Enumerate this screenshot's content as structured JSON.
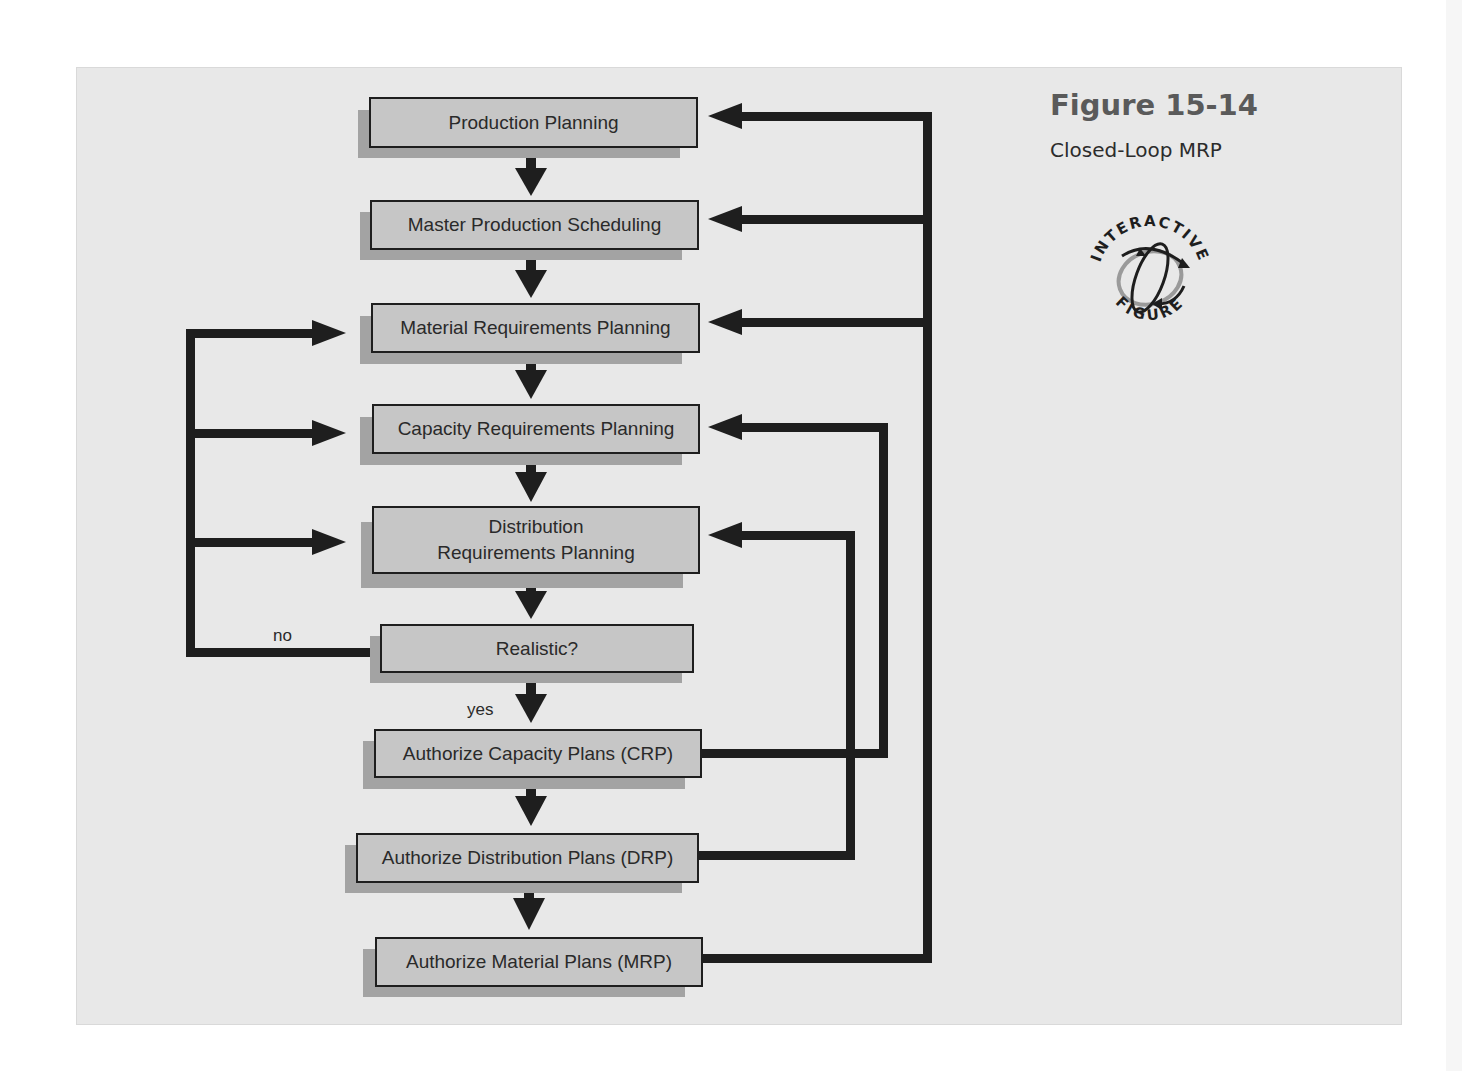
{
  "figure": {
    "number": "Figure 15-14",
    "title": "Closed-Loop MRP",
    "badge": {
      "top_text": "INTERACTIVE",
      "bottom_text": "FIGURE",
      "icon": "interactive-figure-orbit-icon"
    }
  },
  "colors": {
    "panel_bg": "#e8e8e8",
    "box_fill": "#c6c6c6",
    "box_shadow": "#a3a3a3",
    "line": "#1e1e1e",
    "title": "#5a5a5a"
  },
  "flowchart": {
    "nodes": [
      {
        "id": "production-planning",
        "label": "Production Planning"
      },
      {
        "id": "master-production-scheduling",
        "label": "Master Production Scheduling"
      },
      {
        "id": "material-requirements-planning",
        "label": "Material Requirements Planning"
      },
      {
        "id": "capacity-requirements-planning",
        "label": "Capacity Requirements Planning"
      },
      {
        "id": "distribution-requirements-planning",
        "label_line1": "Distribution",
        "label_line2": "Requirements Planning"
      },
      {
        "id": "realistic",
        "label": "Realistic?"
      },
      {
        "id": "authorize-capacity-plans",
        "label": "Authorize Capacity Plans (CRP)"
      },
      {
        "id": "authorize-distribution-plans",
        "label": "Authorize Distribution Plans (DRP)"
      },
      {
        "id": "authorize-material-plans",
        "label": "Authorize Material Plans (MRP)"
      }
    ],
    "edge_labels": {
      "no": "no",
      "yes": "yes"
    },
    "edges": [
      {
        "from": "Production Planning",
        "to": "Master Production Scheduling"
      },
      {
        "from": "Master Production Scheduling",
        "to": "Material Requirements Planning"
      },
      {
        "from": "Material Requirements Planning",
        "to": "Capacity Requirements Planning"
      },
      {
        "from": "Capacity Requirements Planning",
        "to": "Distribution Requirements Planning"
      },
      {
        "from": "Distribution Requirements Planning",
        "to": "Realistic?"
      },
      {
        "from": "Realistic?",
        "to": "Authorize Capacity Plans (CRP)",
        "label": "yes"
      },
      {
        "from": "Realistic?",
        "to": [
          "Material Requirements Planning",
          "Capacity Requirements Planning",
          "Distribution Requirements Planning"
        ],
        "label": "no"
      },
      {
        "from": "Authorize Capacity Plans (CRP)",
        "to": "Authorize Distribution Plans (DRP)"
      },
      {
        "from": "Authorize Distribution Plans (DRP)",
        "to": "Authorize Material Plans (MRP)"
      },
      {
        "from": "Authorize Capacity Plans (CRP)",
        "to": "Capacity Requirements Planning"
      },
      {
        "from": "Authorize Distribution Plans (DRP)",
        "to": "Distribution Requirements Planning"
      },
      {
        "from": "Authorize Material Plans (MRP)",
        "to": [
          "Production Planning",
          "Master Production Scheduling",
          "Material Requirements Planning"
        ]
      }
    ]
  }
}
